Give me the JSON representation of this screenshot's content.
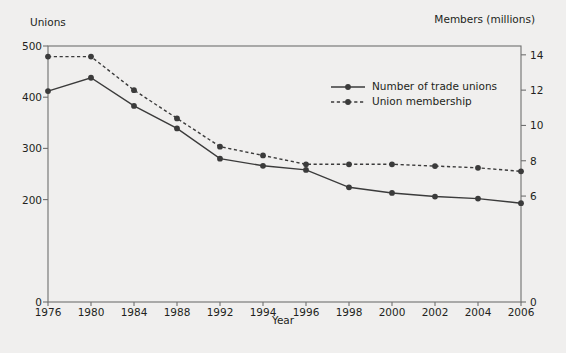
{
  "chart_data": {
    "type": "line",
    "title": "",
    "xlabel": "Year",
    "ylabel_left": "Unions",
    "ylabel_right": "Members (millions)",
    "categories": [
      1976,
      1980,
      1984,
      1988,
      1992,
      1994,
      1996,
      1998,
      2000,
      2002,
      2004,
      2006
    ],
    "xtick_labels": [
      "1976",
      "1980",
      "1984",
      "1988",
      "1992",
      "1994",
      "1996",
      "1998",
      "2000",
      "2002",
      "2004",
      "2006"
    ],
    "ylim_left": [
      0,
      500
    ],
    "ylim_right": [
      0,
      14.5
    ],
    "ytick_left_labels": [
      "0",
      "200",
      "300",
      "400",
      "500"
    ],
    "ytick_left_values": [
      0,
      200,
      300,
      400,
      500
    ],
    "ytick_right_labels": [
      "0",
      "6",
      "8",
      "10",
      "12",
      "14"
    ],
    "ytick_right_values": [
      0,
      6,
      8,
      10,
      12,
      14
    ],
    "grid": false,
    "legend_position": "upper-right-inside",
    "series": [
      {
        "name": "Number of trade unions",
        "axis": "left",
        "style": "solid",
        "marker": "circle",
        "color": "#3b3b3b",
        "values": [
          412,
          438,
          383,
          339,
          280,
          266,
          258,
          224,
          213,
          206,
          202,
          193
        ]
      },
      {
        "name": "Union membership",
        "axis": "right",
        "style": "dashed",
        "marker": "circle",
        "color": "#3b3b3b",
        "values": [
          13.9,
          13.9,
          12.0,
          10.4,
          8.8,
          8.3,
          7.8,
          7.8,
          7.8,
          7.7,
          7.6,
          7.4
        ]
      }
    ],
    "colors": {
      "background": "#f0efee",
      "plot_background": "#f0efee",
      "axis": "#6f6f6f",
      "text": "#231f20",
      "series": "#3b3b3b"
    }
  },
  "legend": {
    "items": [
      {
        "label": "Number of trade unions",
        "style": "solid"
      },
      {
        "label": "Union membership",
        "style": "dashed"
      }
    ]
  }
}
